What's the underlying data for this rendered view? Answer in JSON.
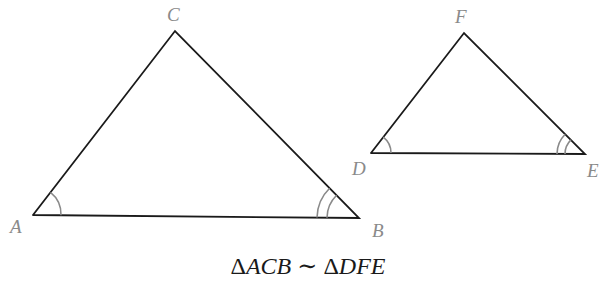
{
  "diagram": {
    "type": "similar-triangles",
    "colors": {
      "edge": "#1a1a1a",
      "angle_mark": "#8a8a8a",
      "label": "#8a8a8a"
    },
    "triangles": [
      {
        "name": "ACB",
        "vertices": {
          "A": {
            "label": "A",
            "x": 33,
            "y": 215,
            "angle_marks": 1
          },
          "C": {
            "label": "C",
            "x": 175,
            "y": 31,
            "angle_marks": 0
          },
          "B": {
            "label": "B",
            "x": 359,
            "y": 218,
            "angle_marks": 2
          }
        }
      },
      {
        "name": "DFE",
        "vertices": {
          "D": {
            "label": "D",
            "x": 371,
            "y": 153,
            "angle_marks": 1
          },
          "F": {
            "label": "F",
            "x": 464,
            "y": 33,
            "angle_marks": 0
          },
          "E": {
            "label": "E",
            "x": 585,
            "y": 154,
            "angle_marks": 2
          }
        }
      }
    ],
    "caption": {
      "delta1": "Δ",
      "tri1": "ACB",
      "similar": " ∼ ",
      "delta2": "Δ",
      "tri2": "DFE"
    }
  }
}
